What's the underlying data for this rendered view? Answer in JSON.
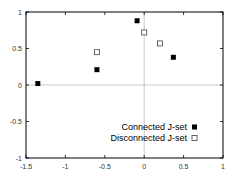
{
  "chart_data": {
    "type": "scatter",
    "title": "",
    "xlabel": "",
    "ylabel": "",
    "xlim": [
      -1.5,
      1
    ],
    "ylim": [
      -1,
      1
    ],
    "xticks": [
      "-1.5",
      "-1",
      "-0.5",
      "0",
      "0.5",
      "1"
    ],
    "yticks": [
      "-1",
      "-0.5",
      "0",
      "0.5",
      "1"
    ],
    "grid": false,
    "zero_lines": true,
    "legend_position": "lower right inside",
    "series": [
      {
        "name": "Connected J-set",
        "marker": "filled-square",
        "color": "#000000",
        "points": [
          [
            -1.35,
            0.02
          ],
          [
            -0.6,
            0.21
          ],
          [
            -0.09,
            0.88
          ],
          [
            0.37,
            0.38
          ]
        ]
      },
      {
        "name": "Disconnected J-set",
        "marker": "hollow-square",
        "color": "#000000",
        "points": [
          [
            -0.6,
            0.45
          ],
          [
            0.0,
            0.72
          ],
          [
            0.2,
            0.57
          ]
        ]
      }
    ]
  }
}
